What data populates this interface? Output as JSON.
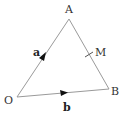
{
  "diagram": {
    "type": "vector-triangle",
    "points": {
      "O": {
        "label": "O",
        "x": 17,
        "y": 97
      },
      "A": {
        "label": "A",
        "x": 69,
        "y": 19
      },
      "B": {
        "label": "B",
        "x": 109,
        "y": 89
      },
      "M": {
        "label": "M",
        "x": 89,
        "y": 54
      }
    },
    "vectors": [
      {
        "from": "O",
        "to": "A",
        "label": "a"
      },
      {
        "from": "O",
        "to": "B",
        "label": "b"
      }
    ],
    "midpoint_tick": {
      "on": "AB",
      "label": "M"
    },
    "colors": {
      "line": "#999999",
      "arrow": "#111111",
      "text": "#333333"
    }
  }
}
